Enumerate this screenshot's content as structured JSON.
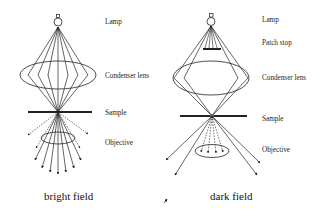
{
  "figure": {
    "type": "optical-microscope-illumination-comparison",
    "panels": [
      {
        "id": "bright",
        "caption": "bright field",
        "labels": {
          "lamp": "Lamp",
          "condenser": "Condenser lens",
          "sample": "Sample",
          "objective": "Objective"
        }
      },
      {
        "id": "dark",
        "caption": "dark field",
        "labels": {
          "lamp": "Lamp",
          "patch_stop": "Patch stop",
          "condenser": "Condenser lens",
          "sample": "Sample",
          "objective": "Objective"
        }
      }
    ],
    "colors": {
      "line": "#222222",
      "background": "#ffffff"
    }
  }
}
